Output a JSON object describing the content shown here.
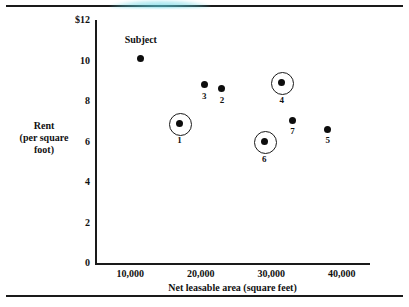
{
  "figure": {
    "background": "#ffffff",
    "ink_color": "#1a1a1a",
    "smudge_color": "#5cd2e1",
    "top_rule": "",
    "bottom_rule": ""
  },
  "chart_data": {
    "type": "scatter",
    "title": "",
    "xlabel": "Net leasable area (square feet)",
    "ylabel_lines": [
      "Rent",
      "(per square",
      "foot)"
    ],
    "ylabel": "Rent (per square foot)",
    "xlim": [
      5000,
      44000
    ],
    "ylim": [
      0,
      12
    ],
    "grid": false,
    "legend": "none",
    "xticks": [
      10000,
      20000,
      30000,
      40000
    ],
    "xticklabels": [
      "10,000",
      "20,000",
      "30,000",
      "40,000"
    ],
    "yticks": [
      0,
      2,
      4,
      6,
      8,
      10,
      12
    ],
    "yticklabels": [
      "0",
      "2",
      "4",
      "6",
      "8",
      "10",
      "$12"
    ],
    "annotations": [
      {
        "text": "Subject",
        "x": 11500,
        "y": 11.0
      }
    ],
    "points": [
      {
        "label": "Subject",
        "label_shown": false,
        "x": 11500,
        "y": 10.1,
        "circled": false,
        "label_pos": "none"
      },
      {
        "label": "1",
        "label_shown": true,
        "x": 17000,
        "y": 6.9,
        "circled": true,
        "label_pos": "below"
      },
      {
        "label": "3",
        "label_shown": true,
        "x": 20500,
        "y": 8.8,
        "circled": false,
        "label_pos": "below"
      },
      {
        "label": "2",
        "label_shown": true,
        "x": 23000,
        "y": 8.6,
        "circled": false,
        "label_pos": "below"
      },
      {
        "label": "6",
        "label_shown": true,
        "x": 29000,
        "y": 6.0,
        "circled": true,
        "label_pos": "below"
      },
      {
        "label": "4",
        "label_shown": true,
        "x": 31500,
        "y": 8.9,
        "circled": true,
        "label_pos": "below"
      },
      {
        "label": "7",
        "label_shown": true,
        "x": 33000,
        "y": 7.05,
        "circled": false,
        "label_pos": "below"
      },
      {
        "label": "5",
        "label_shown": true,
        "x": 38000,
        "y": 6.6,
        "circled": false,
        "label_pos": "below"
      }
    ]
  }
}
